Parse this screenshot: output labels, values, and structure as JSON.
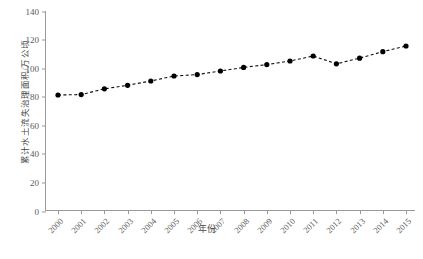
{
  "chart_data": {
    "type": "line",
    "title": "",
    "xlabel": "年份",
    "ylabel": "累计水土流失治理面积/万公顷",
    "categories": [
      "2000",
      "2001",
      "2002",
      "2003",
      "2004",
      "2005",
      "2006",
      "2007",
      "2008",
      "2009",
      "2010",
      "2011",
      "2012",
      "2013",
      "2014",
      "2015"
    ],
    "values": [
      81.2,
      81.5,
      85.5,
      88.0,
      91.0,
      94.5,
      95.5,
      98.0,
      100.5,
      102.5,
      105.0,
      108.5,
      103.0,
      107.0,
      111.5,
      115.5
    ],
    "series": [
      {
        "name": "累计水土流失治理面积",
        "values": [
          81.2,
          81.5,
          85.5,
          88.0,
          91.0,
          94.5,
          95.5,
          98.0,
          100.5,
          102.5,
          105.0,
          108.5,
          103.0,
          107.0,
          111.5,
          115.5
        ]
      }
    ],
    "ylim": [
      0,
      140
    ],
    "yticks": [
      0,
      20,
      40,
      60,
      80,
      100,
      120,
      140
    ],
    "ytick_labels": [
      "0",
      "20",
      "40",
      "60",
      "80",
      "100",
      "120",
      "140"
    ],
    "xtick_labels": [
      "2000",
      "2001",
      "2002",
      "2003",
      "2004",
      "2005",
      "2006",
      "2007",
      "2008",
      "2009",
      "2010",
      "2011",
      "2012",
      "2013",
      "2014",
      "2015"
    ],
    "grid": false,
    "legend": "none",
    "line_style": "dashed",
    "marker": "filled-circle",
    "line_color": "#111111",
    "marker_color": "#000000",
    "axis_color": "#9a9a9a",
    "background_color": "#ffffff",
    "xtick_rotation": -45
  }
}
